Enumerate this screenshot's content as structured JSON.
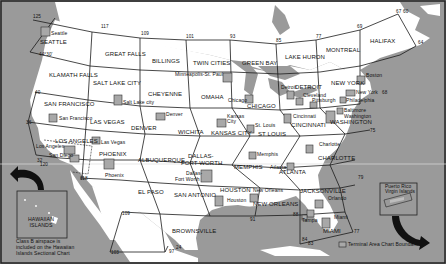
{
  "map": {
    "sectional_areas": [
      {
        "name": "SEATTLE",
        "x": 40,
        "y": 39
      },
      {
        "name": "GREAT FALLS",
        "x": 105,
        "y": 54
      },
      {
        "name": "BILLINGS",
        "x": 152,
        "y": 61
      },
      {
        "name": "TWIN CITIES",
        "x": 193,
        "y": 64
      },
      {
        "name": "GREEN BAY",
        "x": 242,
        "y": 64
      },
      {
        "name": "LAKE HURON",
        "x": 287,
        "y": 57
      },
      {
        "name": "MONTREAL",
        "x": 327,
        "y": 51
      },
      {
        "name": "HALIFAX",
        "x": 370,
        "y": 42
      },
      {
        "name": "KLAMATH FALLS",
        "x": 49,
        "y": 75
      },
      {
        "name": "SALT LAKE CITY",
        "x": 93,
        "y": 82
      },
      {
        "name": "CHEYENNE",
        "x": 148,
        "y": 95
      },
      {
        "name": "OMAHA",
        "x": 201,
        "y": 98
      },
      {
        "name": "CHICAGO",
        "x": 247,
        "y": 106
      },
      {
        "name": "DETROIT",
        "x": 295,
        "y": 86
      },
      {
        "name": "NEW YORK",
        "x": 331,
        "y": 82
      },
      {
        "name": "SAN FRANCISCO",
        "x": 44,
        "y": 103
      },
      {
        "name": "LAS VEGAS",
        "x": 90,
        "y": 122
      },
      {
        "name": "DENVER",
        "x": 131,
        "y": 129
      },
      {
        "name": "WICHITA",
        "x": 178,
        "y": 132
      },
      {
        "name": "KANSAS CITY",
        "x": 213,
        "y": 133
      },
      {
        "name": "ST LOUIS",
        "x": 259,
        "y": 135
      },
      {
        "name": "CINCINNATI",
        "x": 294,
        "y": 124
      },
      {
        "name": "WASHINGTON",
        "x": 331,
        "y": 122
      },
      {
        "name": "LOS ANGELES",
        "x": 55,
        "y": 140
      },
      {
        "name": "PHOENIX",
        "x": 99,
        "y": 155
      },
      {
        "name": "ALBUQUERQUE",
        "x": 140,
        "y": 161
      },
      {
        "name": "DALLAS-",
        "x": 188,
        "y": 156
      },
      {
        "name": "FORT WORTH",
        "x": 181,
        "y": 163
      },
      {
        "name": "MEMPHIS",
        "x": 235,
        "y": 167
      },
      {
        "name": "ATLANTA",
        "x": 280,
        "y": 171
      },
      {
        "name": "CHARLOTTE",
        "x": 320,
        "y": 158
      },
      {
        "name": "EL PASO",
        "x": 138,
        "y": 193
      },
      {
        "name": "SAN ANTONIO",
        "x": 174,
        "y": 196
      },
      {
        "name": "HOUSTON",
        "x": 221,
        "y": 190
      },
      {
        "name": "NEW ORLEANS",
        "x": 254,
        "y": 204
      },
      {
        "name": "JACKSONVILLE",
        "x": 300,
        "y": 190
      },
      {
        "name": "MIAMI",
        "x": 323,
        "y": 230
      },
      {
        "name": "BROWNSVILLE",
        "x": 172,
        "y": 231
      }
    ],
    "terminal_areas": [
      {
        "name": "Seattle",
        "x": 51,
        "y": 30,
        "bx": 41,
        "by": 27
      },
      {
        "name": "Minneapolis-St. Paul",
        "x": 175,
        "y": 73,
        "bx": 223,
        "by": 73
      },
      {
        "name": "Salt Lake city",
        "x": 125,
        "y": 100,
        "bx": 114,
        "by": 95
      },
      {
        "name": "Denver",
        "x": 165,
        "y": 113,
        "bx": 156,
        "by": 113
      },
      {
        "name": "Chicago",
        "x": 228,
        "y": 98,
        "bx": 245,
        "by": 95
      },
      {
        "name": "Detroit",
        "x": 283,
        "y": 84,
        "bx": 287,
        "by": 91
      },
      {
        "name": "Cleveland",
        "x": 304,
        "y": 93,
        "bx": 296,
        "by": 98
      },
      {
        "name": "Pittsburgh",
        "x": 312,
        "y": 99,
        "bx": 310,
        "by": 102
      },
      {
        "name": "Boston",
        "x": 368,
        "y": 73,
        "bx": 357,
        "by": 76
      },
      {
        "name": "New York",
        "x": 357,
        "y": 91,
        "bx": 346,
        "by": 90
      },
      {
        "name": "Philadelphia",
        "x": 346,
        "y": 99,
        "bx": 340,
        "by": 97
      },
      {
        "name": "Baltimore",
        "x": 344,
        "y": 109,
        "bx": 337,
        "by": 108
      },
      {
        "name": "Washington",
        "x": 344,
        "y": 114,
        "bx": 326,
        "by": 111
      },
      {
        "name": "San Francisco",
        "x": 60,
        "y": 117,
        "bx": 49,
        "by": 114
      },
      {
        "name": "Las Vegas",
        "x": 103,
        "y": 140,
        "bx": 92,
        "by": 137
      },
      {
        "name": "Kansas City",
        "x": 227,
        "y": 116,
        "bx": 217,
        "by": 119
      },
      {
        "name": "St. Louis",
        "x": 254,
        "y": 123,
        "bx": 247,
        "by": 125
      },
      {
        "name": "Cincinnati",
        "x": 296,
        "y": 114,
        "bx": 284,
        "by": 114
      },
      {
        "name": "Los Angeles",
        "x": 37,
        "y": 144,
        "bx": 64,
        "by": 146
      },
      {
        "name": "San Diego",
        "x": 50,
        "y": 152,
        "bx": 70,
        "by": 155
      },
      {
        "name": "Phoenix",
        "x": 105,
        "y": 173,
        "bx": 104,
        "by": 159
      },
      {
        "name": "Dallas-",
        "x": 185,
        "y": 171,
        "bx": 201,
        "by": 170
      },
      {
        "name": "Fort Worth",
        "x": 175,
        "y": 177,
        "bx": 201,
        "by": 170
      },
      {
        "name": "Memphis",
        "x": 263,
        "y": 154,
        "bx": 249,
        "by": 152
      },
      {
        "name": "Atlanta",
        "x": 272,
        "y": 165,
        "bx": 287,
        "by": 163
      },
      {
        "name": "Charlotte",
        "x": 320,
        "y": 142,
        "bx": 306,
        "by": 145
      },
      {
        "name": "Houston",
        "x": 228,
        "y": 199,
        "bx": 215,
        "by": 196
      },
      {
        "name": "New Orleans",
        "x": 253,
        "y": 188,
        "bx": 250,
        "by": 194
      },
      {
        "name": "Orlando",
        "x": 330,
        "y": 196,
        "bx": 315,
        "by": 200
      },
      {
        "name": "Tampa",
        "x": 303,
        "y": 217,
        "bx": 307,
        "by": 210
      },
      {
        "name": "Miami",
        "x": 336,
        "y": 216,
        "bx": 322,
        "by": 218
      }
    ],
    "longitude_labels": [
      {
        "text": "125",
        "x": 33,
        "y": 17
      },
      {
        "text": "117",
        "x": 101,
        "y": 27
      },
      {
        "text": "109",
        "x": 141,
        "y": 32
      },
      {
        "text": "101",
        "x": 186,
        "y": 35
      },
      {
        "text": "93",
        "x": 230,
        "y": 35
      },
      {
        "text": "85",
        "x": 276,
        "y": 40
      },
      {
        "text": "77",
        "x": 316,
        "y": 35
      },
      {
        "text": "69",
        "x": 361,
        "y": 25
      },
      {
        "text": "67",
        "x": 389,
        "y": 8
      },
      {
        "text": "60",
        "x": 395,
        "y": 10
      },
      {
        "text": "64",
        "x": 415,
        "y": 42
      },
      {
        "text": "68",
        "x": 385,
        "y": 92
      },
      {
        "text": "75",
        "x": 372,
        "y": 130
      },
      {
        "text": "79",
        "x": 357,
        "y": 178
      },
      {
        "text": "77",
        "x": 353,
        "y": 230
      },
      {
        "text": "83",
        "x": 308,
        "y": 242
      },
      {
        "text": "84",
        "x": 303,
        "y": 238
      },
      {
        "text": "88",
        "x": 281,
        "y": 213
      },
      {
        "text": "91",
        "x": 250,
        "y": 216
      },
      {
        "text": "97",
        "x": 169,
        "y": 250
      },
      {
        "text": "24",
        "x": 177,
        "y": 246
      },
      {
        "text": "103",
        "x": 111,
        "y": 250
      },
      {
        "text": "109",
        "x": 122,
        "y": 213
      },
      {
        "text": "118",
        "x": 83,
        "y": 177
      },
      {
        "text": "120",
        "x": 40,
        "y": 163
      },
      {
        "text": "36",
        "x": 28,
        "y": 121
      },
      {
        "text": "40",
        "x": 36,
        "y": 91
      },
      {
        "text": "44°30'",
        "x": 40,
        "y": 53
      },
      {
        "text": "32",
        "x": 34,
        "y": 155
      }
    ],
    "hawaii": {
      "title_line1": "HAWAIIAN",
      "title_line2": "ISLANDS",
      "note_line1": "Class B airspace is",
      "note_line2": "included on the Hawaiian",
      "note_line3": "Islands Sectional Chart"
    },
    "puerto_rico": {
      "line1": "Puerto Rico",
      "line2": "Virgin Islands"
    },
    "legend": {
      "label": "Terminal Area Chart Boundaries"
    },
    "colors": {
      "water": "#9a9a9a",
      "land": "#ffffff",
      "terminal_box": "#a8a8a8",
      "lines": "#1a1a1a"
    }
  }
}
